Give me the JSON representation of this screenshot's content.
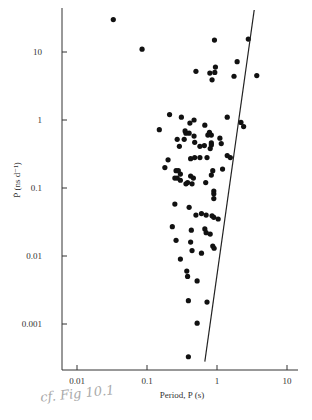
{
  "chart_data": {
    "type": "scatter",
    "title": "",
    "xlabel": "Period, P (s)",
    "ylabel": "Ṗ (ns d⁻¹)",
    "xscale": "log",
    "yscale": "log",
    "xlim": [
      0.006,
      20
    ],
    "ylim": [
      0.00025,
      40
    ],
    "x_ticks": [
      0.01,
      0.1,
      1,
      10
    ],
    "x_tick_labels": [
      "0.01",
      "0.1",
      "1",
      "10"
    ],
    "y_ticks": [
      0.001,
      0.01,
      0.1,
      1,
      10
    ],
    "y_tick_labels": [
      "0.001",
      "0.01",
      "0.1",
      "1",
      "10"
    ],
    "grid": false,
    "legend": null,
    "line": {
      "from": [
        0.67,
        0.00028
      ],
      "to": [
        3.4,
        50
      ],
      "description": "diagonal boundary line"
    },
    "points": [
      [
        0.033,
        30
      ],
      [
        0.085,
        11
      ],
      [
        0.92,
        15
      ],
      [
        2.8,
        15.5
      ],
      [
        0.5,
        5.2
      ],
      [
        0.95,
        6
      ],
      [
        0.79,
        4.9
      ],
      [
        0.93,
        5
      ],
      [
        0.85,
        3.9
      ],
      [
        1.75,
        4.4
      ],
      [
        1.94,
        7.2
      ],
      [
        3.7,
        4.5
      ],
      [
        0.21,
        1.2
      ],
      [
        0.31,
        1.1
      ],
      [
        0.47,
        1
      ],
      [
        0.41,
        0.9
      ],
      [
        0.67,
        0.84
      ],
      [
        1.4,
        1.1
      ],
      [
        2.2,
        0.92
      ],
      [
        2.4,
        0.8
      ],
      [
        0.15,
        0.72
      ],
      [
        0.36,
        0.64
      ],
      [
        0.47,
        0.58
      ],
      [
        0.4,
        0.64
      ],
      [
        0.27,
        0.52
      ],
      [
        0.34,
        0.52
      ],
      [
        0.35,
        0.69
      ],
      [
        0.74,
        0.6
      ],
      [
        0.78,
        0.66
      ],
      [
        0.83,
        0.6
      ],
      [
        1.1,
        0.54
      ],
      [
        0.29,
        0.41
      ],
      [
        0.57,
        0.41
      ],
      [
        0.66,
        0.42
      ],
      [
        0.48,
        0.47
      ],
      [
        0.83,
        0.46
      ],
      [
        1.15,
        0.45
      ],
      [
        0.83,
        0.43
      ],
      [
        1.4,
        0.3
      ],
      [
        1.55,
        0.28
      ],
      [
        0.8,
        0.38
      ],
      [
        0.2,
        0.26
      ],
      [
        0.42,
        0.27
      ],
      [
        0.48,
        0.28
      ],
      [
        0.57,
        0.28
      ],
      [
        0.72,
        0.28
      ],
      [
        0.18,
        0.2
      ],
      [
        0.26,
        0.18
      ],
      [
        0.28,
        0.18
      ],
      [
        0.3,
        0.16
      ],
      [
        0.42,
        0.15
      ],
      [
        0.25,
        0.14
      ],
      [
        0.27,
        0.14
      ],
      [
        0.46,
        0.14
      ],
      [
        1.2,
        0.19
      ],
      [
        0.87,
        0.18
      ],
      [
        0.83,
        0.155
      ],
      [
        0.3,
        0.13
      ],
      [
        0.38,
        0.12
      ],
      [
        0.36,
        0.115
      ],
      [
        0.44,
        0.115
      ],
      [
        0.69,
        0.12
      ],
      [
        0.9,
        0.09
      ],
      [
        0.9,
        0.082
      ],
      [
        0.9,
        0.07
      ],
      [
        0.25,
        0.058
      ],
      [
        0.4,
        0.052
      ],
      [
        0.5,
        0.04
      ],
      [
        0.6,
        0.042
      ],
      [
        0.7,
        0.04
      ],
      [
        0.85,
        0.039
      ],
      [
        0.9,
        0.037
      ],
      [
        1.04,
        0.035
      ],
      [
        0.67,
        0.025
      ],
      [
        0.23,
        0.027
      ],
      [
        0.43,
        0.024
      ],
      [
        0.7,
        0.022
      ],
      [
        0.8,
        0.021
      ],
      [
        0.26,
        0.017
      ],
      [
        0.42,
        0.016
      ],
      [
        0.87,
        0.014
      ],
      [
        0.91,
        0.013
      ],
      [
        0.44,
        0.012
      ],
      [
        0.6,
        0.011
      ],
      [
        0.3,
        0.009
      ],
      [
        0.37,
        0.006
      ],
      [
        0.38,
        0.005
      ],
      [
        0.52,
        0.0043
      ],
      [
        0.39,
        0.0022
      ],
      [
        0.72,
        0.0021
      ],
      [
        0.52,
        0.00103
      ],
      [
        0.39,
        0.00033
      ]
    ]
  },
  "annotation": {
    "handwritten": "cf. Fig 10.1"
  }
}
